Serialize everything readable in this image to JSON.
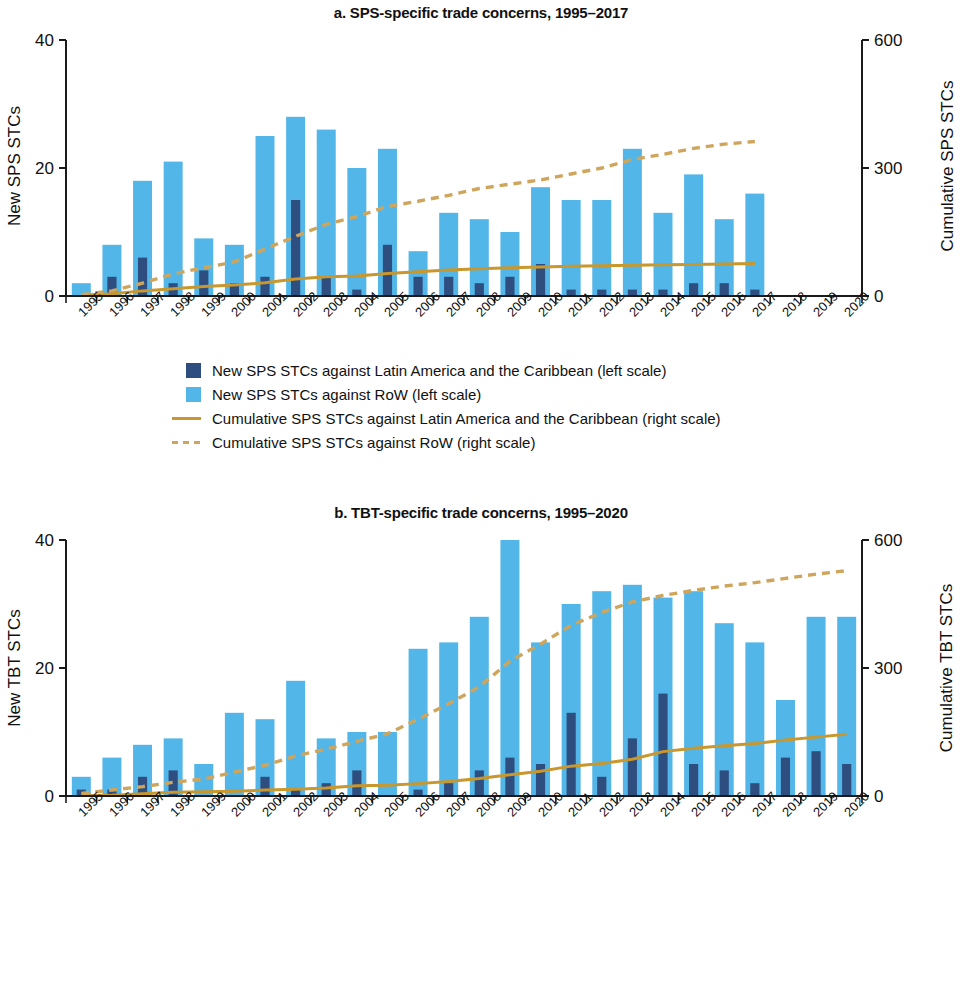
{
  "colors": {
    "bar_lac": "#2e4e80",
    "bar_row": "#52b6e8",
    "line_lac": "#c9972c",
    "line_row": "#cfa55c",
    "axis": "#1a1a1a",
    "text": "#111111"
  },
  "panels": [
    {
      "id": "a",
      "title": "a. SPS-specific trade concerns, 1995–2017",
      "ylabel_left": "New SPS STCs",
      "ylabel_right": "Cumulative SPS STCs",
      "legend": [
        {
          "type": "swatch",
          "color": "#2e4e80",
          "label": "New SPS STCs against Latin America and the Caribbean (left scale)"
        },
        {
          "type": "swatch",
          "color": "#52b6e8",
          "label": "New SPS STCs against RoW (left scale)"
        },
        {
          "type": "line",
          "color": "#c9972c",
          "dashed": false,
          "label": "Cumulative SPS STCs against Latin America and the Caribbean (right scale)"
        },
        {
          "type": "line",
          "color": "#cfa55c",
          "dashed": true,
          "label": "Cumulative SPS STCs against RoW (right scale)"
        }
      ]
    },
    {
      "id": "b",
      "title": "b. TBT-specific trade concerns, 1995–2020",
      "ylabel_left": "New TBT STCs",
      "ylabel_right": "Cumulative TBT STCs",
      "legend": [
        {
          "type": "swatch",
          "color": "#2e4e80",
          "label": "New TBT STCs against Latin America and the Caribbean (left scale)"
        },
        {
          "type": "swatch",
          "color": "#52b6e8",
          "label": "New TBT STCs against RoW (left scale)"
        },
        {
          "type": "line",
          "color": "#c9972c",
          "dashed": false,
          "label": "Cumulative TBT STCs against Latin America and the Caribbean (right scale)"
        },
        {
          "type": "line",
          "color": "#cfa55c",
          "dashed": true,
          "label": "Cumulative TBT STCs against RoW (right scale)"
        }
      ]
    }
  ],
  "chart_data": [
    {
      "type": "bar",
      "panel": "a",
      "title": "a. SPS-specific trade concerns, 1995–2017",
      "xlabel": "",
      "ylabel": "New SPS STCs",
      "ylabel_right": "Cumulative SPS STCs",
      "ylim": [
        0,
        40
      ],
      "yticks": [
        0,
        20,
        40
      ],
      "ylim_right": [
        0,
        600
      ],
      "yticks_right": [
        0,
        300,
        600
      ],
      "grid": false,
      "legend_position": "below",
      "categories": [
        "1995",
        "1996",
        "1997",
        "1998",
        "1999",
        "2000",
        "2001",
        "2002",
        "2003",
        "2004",
        "2005",
        "2006",
        "2007",
        "2008",
        "2009",
        "2010",
        "2011",
        "2012",
        "2013",
        "2014",
        "2015",
        "2016",
        "2017",
        "2018",
        "2019",
        "2020"
      ],
      "series": [
        {
          "name": "New SPS STCs against RoW (left scale)",
          "kind": "bar",
          "axis": "left",
          "values": [
            2,
            8,
            18,
            21,
            9,
            8,
            25,
            28,
            26,
            20,
            23,
            7,
            13,
            12,
            10,
            17,
            15,
            15,
            23,
            13,
            19,
            12,
            16,
            null,
            null,
            null
          ]
        },
        {
          "name": "New SPS STCs against Latin America and the Caribbean (left scale)",
          "kind": "bar",
          "axis": "left",
          "values": [
            0,
            3,
            6,
            2,
            4,
            2,
            3,
            15,
            3,
            1,
            8,
            3,
            3,
            2,
            3,
            5,
            1,
            1,
            1,
            1,
            2,
            2,
            1,
            null,
            null,
            null
          ]
        },
        {
          "name": "Cumulative SPS STCs against Latin America and the Caribbean (right scale)",
          "kind": "line",
          "axis": "right",
          "dashed": false,
          "values": [
            2,
            5,
            12,
            17,
            22,
            26,
            31,
            40,
            45,
            47,
            53,
            57,
            61,
            64,
            66,
            68,
            70,
            71,
            72,
            73,
            74,
            75,
            76,
            null,
            null,
            null
          ]
        },
        {
          "name": "Cumulative SPS STCs against RoW (right scale)",
          "kind": "line",
          "axis": "right",
          "dashed": true,
          "values": [
            3,
            12,
            30,
            52,
            66,
            80,
            110,
            140,
            168,
            186,
            210,
            222,
            236,
            252,
            262,
            272,
            286,
            300,
            320,
            332,
            346,
            356,
            362,
            null,
            null,
            null
          ]
        }
      ]
    },
    {
      "type": "bar",
      "panel": "b",
      "title": "b. TBT-specific trade concerns, 1995–2020",
      "xlabel": "",
      "ylabel": "New TBT STCs",
      "ylabel_right": "Cumulative TBT STCs",
      "ylim": [
        0,
        40
      ],
      "yticks": [
        0,
        20,
        40
      ],
      "ylim_right": [
        0,
        600
      ],
      "yticks_right": [
        0,
        300,
        600
      ],
      "grid": false,
      "legend_position": "below",
      "categories": [
        "1995",
        "1996",
        "1997",
        "1998",
        "1999",
        "2000",
        "2001",
        "2002",
        "2003",
        "2004",
        "2005",
        "2006",
        "2007",
        "2008",
        "2009",
        "2010",
        "2011",
        "2012",
        "2013",
        "2014",
        "2015",
        "2016",
        "2017",
        "2018",
        "2019",
        "2020"
      ],
      "series": [
        {
          "name": "New TBT STCs against RoW (left scale)",
          "kind": "bar",
          "axis": "left",
          "values": [
            3,
            6,
            8,
            9,
            5,
            13,
            12,
            18,
            9,
            10,
            10,
            23,
            24,
            28,
            40,
            24,
            30,
            32,
            33,
            31,
            32,
            27,
            24,
            15,
            28,
            28
          ]
        },
        {
          "name": "New TBT STCs against Latin America and the Caribbean (left scale)",
          "kind": "bar",
          "axis": "left",
          "values": [
            1,
            1,
            3,
            4,
            0,
            0,
            3,
            1,
            2,
            4,
            0,
            1,
            2,
            4,
            6,
            5,
            13,
            3,
            9,
            16,
            5,
            4,
            2,
            6,
            7,
            5
          ]
        },
        {
          "name": "Cumulative TBT STCs against Latin America and the Caribbean (right scale)",
          "kind": "line",
          "axis": "right",
          "dashed": false,
          "values": [
            1,
            2,
            5,
            9,
            10,
            11,
            14,
            16,
            19,
            24,
            25,
            29,
            34,
            41,
            50,
            58,
            70,
            76,
            86,
            104,
            112,
            118,
            123,
            131,
            138,
            145
          ]
        },
        {
          "name": "Cumulative TBT STCs against RoW (right scale)",
          "kind": "line",
          "axis": "right",
          "dashed": true,
          "values": [
            6,
            14,
            22,
            32,
            40,
            56,
            72,
            94,
            110,
            128,
            146,
            180,
            216,
            256,
            316,
            356,
            400,
            430,
            455,
            470,
            482,
            492,
            500,
            510,
            520,
            528
          ]
        }
      ]
    }
  ]
}
